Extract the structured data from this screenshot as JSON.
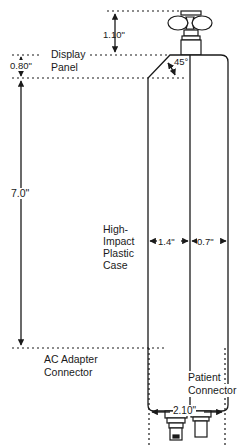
{
  "diagram": {
    "type": "technical-dimension-drawing",
    "line_color": "#1a1a1a",
    "background": "#ffffff",
    "labels": {
      "display_panel": [
        "Display",
        "Panel"
      ],
      "case": [
        "High-",
        "Impact",
        "Plastic",
        "Case"
      ],
      "ac_adapter": [
        "AC Adapter",
        "Connector"
      ],
      "patient_connector": [
        "Patient",
        "Connector"
      ]
    },
    "dimensions": {
      "valve_height": "1.10\"",
      "display_panel_height": "0.80\"",
      "body_height": "7.0\"",
      "front_width": "1.4\"",
      "side_width": "0.7\"",
      "connector_span": "2.10\"",
      "bevel_angle": "45°"
    }
  }
}
